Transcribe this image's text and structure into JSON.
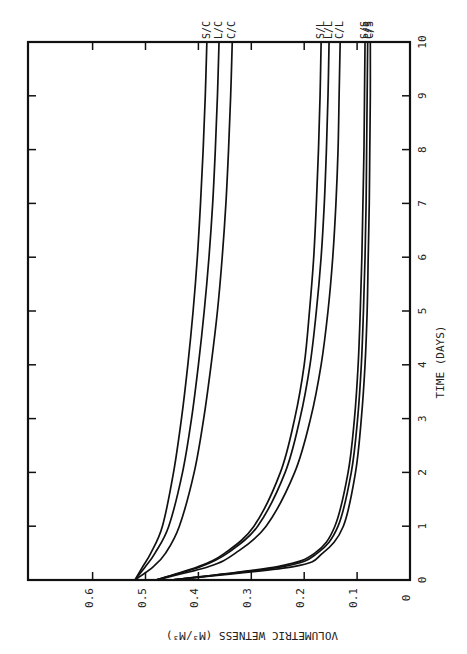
{
  "chart_data": {
    "type": "line",
    "orientation": "rotated-90",
    "title": "",
    "xlabel": "TIME (DAYS)",
    "ylabel": "VOLUMETRIC WETNESS (M3/M3)",
    "ylabel_display": "VOLUMETRIC WETNESS (M³/M³)",
    "xlim": [
      0,
      10
    ],
    "ylim": [
      0,
      0.7
    ],
    "x_ticks": [
      "0",
      "1",
      "2",
      "3",
      "4",
      "5",
      "6",
      "7",
      "8",
      "9",
      "10"
    ],
    "y_ticks": [
      "0",
      "0.1",
      "0.2",
      "0.3",
      "0.4",
      "0.5",
      "0.6"
    ],
    "grid": false,
    "legend": "inline labels at curve ends",
    "x": [
      0,
      0.25,
      0.5,
      1,
      2,
      3,
      4,
      5,
      6,
      7,
      8,
      9,
      10
    ],
    "series": [
      {
        "name": "S/C",
        "values": [
          0.52,
          0.505,
          0.49,
          0.468,
          0.447,
          0.432,
          0.42,
          0.41,
          0.402,
          0.396,
          0.391,
          0.387,
          0.384
        ]
      },
      {
        "name": "L/C",
        "values": [
          0.52,
          0.5,
          0.482,
          0.456,
          0.43,
          0.413,
          0.4,
          0.389,
          0.38,
          0.373,
          0.368,
          0.364,
          0.361
        ]
      },
      {
        "name": "C/C",
        "values": [
          0.52,
          0.485,
          0.462,
          0.436,
          0.408,
          0.39,
          0.376,
          0.364,
          0.355,
          0.348,
          0.343,
          0.339,
          0.336
        ]
      },
      {
        "name": "S/L",
        "values": [
          0.48,
          0.4,
          0.35,
          0.295,
          0.245,
          0.218,
          0.2,
          0.19,
          0.182,
          0.177,
          0.173,
          0.17,
          0.168
        ]
      },
      {
        "name": "L/L",
        "values": [
          0.48,
          0.395,
          0.345,
          0.288,
          0.236,
          0.208,
          0.189,
          0.177,
          0.168,
          0.162,
          0.158,
          0.155,
          0.153
        ]
      },
      {
        "name": "C/L",
        "values": [
          0.48,
          0.38,
          0.33,
          0.272,
          0.218,
          0.188,
          0.168,
          0.155,
          0.146,
          0.14,
          0.136,
          0.134,
          0.132
        ]
      },
      {
        "name": "S/S",
        "values": [
          0.45,
          0.25,
          0.18,
          0.142,
          0.117,
          0.105,
          0.098,
          0.094,
          0.091,
          0.089,
          0.087,
          0.086,
          0.085
        ]
      },
      {
        "name": "L/S",
        "values": [
          0.45,
          0.24,
          0.175,
          0.136,
          0.111,
          0.099,
          0.092,
          0.088,
          0.085,
          0.083,
          0.082,
          0.081,
          0.08
        ]
      },
      {
        "name": "C/S",
        "values": [
          0.45,
          0.22,
          0.165,
          0.126,
          0.103,
          0.092,
          0.085,
          0.081,
          0.079,
          0.077,
          0.076,
          0.075,
          0.075
        ]
      }
    ]
  },
  "layout": {
    "frame": {
      "left": 28,
      "right": 410,
      "top": 42,
      "bottom": 580
    },
    "wetness_zero_px": 410,
    "px_per_wetness_unit": 529,
    "line_color": "#111111",
    "background": "#ffffff"
  }
}
